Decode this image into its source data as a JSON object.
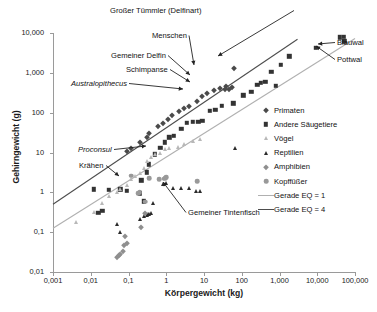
{
  "chart_data": {
    "type": "scatter",
    "title": "",
    "xlabel": "Körpergewicht (kg)",
    "ylabel": "Gehirngewicht (g)",
    "xscale": "log",
    "yscale": "log",
    "xlim": [
      0.001,
      100000
    ],
    "ylim": [
      0.01,
      10000
    ],
    "xticks": [
      "0,001",
      "0,01",
      "0,1",
      "1",
      "10",
      "100",
      "1,000",
      "10,000",
      "100,000"
    ],
    "xtick_values": [
      0.001,
      0.01,
      0.1,
      1,
      10,
      100,
      1000,
      10000,
      100000
    ],
    "yticks": [
      "0,01",
      "0,1",
      "1",
      "10",
      "100",
      "1,000",
      "10,000"
    ],
    "ytick_values": [
      0.01,
      0.1,
      1,
      10,
      100,
      1000,
      10000
    ],
    "grid": false,
    "legend_position": "right",
    "series": [
      {
        "name": "Primaten",
        "marker": "diamond",
        "color": "#4a4a4a",
        "points": [
          [
            0.09,
            11
          ],
          [
            0.12,
            13
          ],
          [
            0.2,
            18
          ],
          [
            0.3,
            24
          ],
          [
            0.35,
            30
          ],
          [
            0.6,
            45
          ],
          [
            0.8,
            55
          ],
          [
            1.1,
            70
          ],
          [
            1.4,
            85
          ],
          [
            2.2,
            110
          ],
          [
            3.0,
            130
          ],
          [
            4.0,
            150
          ],
          [
            6.5,
            200
          ],
          [
            9.0,
            260
          ],
          [
            12,
            310
          ],
          [
            18,
            380
          ],
          [
            26,
            420
          ],
          [
            38,
            480
          ],
          [
            55,
            430
          ],
          [
            62,
            1350
          ],
          [
            45,
            400
          ],
          [
            35,
            390
          ]
        ]
      },
      {
        "name": "Andere Säugetiere",
        "marker": "square",
        "color": "#333333",
        "points": [
          [
            0.012,
            1.2
          ],
          [
            0.016,
            0.31
          ],
          [
            0.02,
            0.34
          ],
          [
            0.03,
            1.15
          ],
          [
            0.06,
            1.2
          ],
          [
            0.09,
            1.1
          ],
          [
            0.2,
            0.95
          ],
          [
            0.25,
            0.6
          ],
          [
            0.22,
            2.0
          ],
          [
            0.3,
            3.2
          ],
          [
            0.35,
            5.0
          ],
          [
            0.5,
            9.0
          ],
          [
            0.7,
            13
          ],
          [
            0.9,
            18
          ],
          [
            1.2,
            24
          ],
          [
            1.6,
            26
          ],
          [
            2.5,
            40
          ],
          [
            3.5,
            55
          ],
          [
            5.0,
            58
          ],
          [
            7.0,
            60
          ],
          [
            9.0,
            62
          ],
          [
            14,
            110
          ],
          [
            20,
            120
          ],
          [
            30,
            150
          ],
          [
            60,
            170
          ],
          [
            110,
            270
          ],
          [
            180,
            330
          ],
          [
            260,
            500
          ],
          [
            320,
            560
          ],
          [
            420,
            600
          ],
          [
            600,
            1050
          ],
          [
            800,
            480
          ],
          [
            1100,
            1600
          ],
          [
            1800,
            2600
          ],
          [
            9000,
            4200
          ],
          [
            40000,
            7800
          ],
          [
            50000,
            7900
          ],
          [
            52000,
            6200
          ]
        ]
      },
      {
        "name": "Vögel",
        "marker": "triangle",
        "color": "#b8b8b8",
        "points": [
          [
            0.004,
            0.18
          ],
          [
            0.012,
            0.32
          ],
          [
            0.02,
            0.55
          ],
          [
            0.03,
            0.8
          ],
          [
            0.05,
            1.0
          ],
          [
            0.06,
            1.2
          ],
          [
            0.09,
            1.5
          ],
          [
            0.12,
            2.2
          ],
          [
            0.15,
            2.6
          ],
          [
            0.2,
            3.0
          ],
          [
            0.25,
            4.2
          ],
          [
            0.3,
            6.0
          ],
          [
            0.4,
            7.5
          ],
          [
            0.5,
            9.0
          ],
          [
            0.7,
            10
          ],
          [
            0.9,
            12
          ],
          [
            1.2,
            13
          ],
          [
            2.0,
            14
          ],
          [
            3.0,
            16
          ],
          [
            5.0,
            20
          ],
          [
            8.0,
            22
          ]
        ]
      },
      {
        "name": "Reptilien",
        "marker": "triangle",
        "color": "#2b2b2b",
        "points": [
          [
            0.05,
            0.16
          ],
          [
            0.06,
            0.1
          ],
          [
            0.2,
            0.21
          ],
          [
            0.25,
            0.26
          ],
          [
            0.3,
            0.27
          ],
          [
            0.32,
            0.28
          ],
          [
            0.35,
            0.29
          ],
          [
            0.4,
            0.3
          ],
          [
            0.45,
            0.55
          ],
          [
            0.8,
            1.6
          ],
          [
            1.0,
            1.7
          ],
          [
            1.5,
            1.3
          ],
          [
            2.5,
            1.25
          ],
          [
            4.0,
            1.3
          ],
          [
            6.0,
            1.05
          ],
          [
            8.0,
            1.1
          ],
          [
            65,
            13
          ]
        ]
      },
      {
        "name": "Amphibien",
        "marker": "diamond",
        "color": "#8f8f8f",
        "points": [
          [
            0.05,
            0.024
          ],
          [
            0.055,
            0.026
          ],
          [
            0.06,
            0.028
          ],
          [
            0.07,
            0.033
          ],
          [
            0.075,
            0.048
          ],
          [
            0.09,
            0.052
          ],
          [
            0.08,
            0.082
          ],
          [
            0.22,
            0.135
          ],
          [
            0.28,
            0.3
          ]
        ]
      },
      {
        "name": "Kopffüßer",
        "marker": "circle",
        "color": "#999999",
        "points": [
          [
            0.18,
            0.95
          ],
          [
            0.2,
            1.0
          ],
          [
            0.28,
            0.58
          ],
          [
            0.35,
            2.3
          ],
          [
            0.65,
            2.1
          ],
          [
            0.85,
            2.2
          ],
          [
            0.95,
            2.3
          ],
          [
            1.0,
            2.4
          ],
          [
            6.5,
            1.9
          ],
          [
            0.12,
            2.6
          ]
        ]
      }
    ],
    "lines": [
      {
        "name": "Gerade EQ = 1",
        "color": "#b0b0b0",
        "from": [
          0.001,
          0.125
        ],
        "to": [
          100000,
          7300
        ]
      },
      {
        "name": "Gerade EQ = 4",
        "color": "#4d4d4d",
        "from": [
          0.001,
          0.5
        ],
        "to": [
          3000,
          7000
        ]
      }
    ],
    "annotations": [
      {
        "label": "Großer Tümmler (Delfinart)",
        "italic": false,
        "text_x": 201,
        "text_y": 6,
        "tip_x": 218,
        "tip_y": 56
      },
      {
        "label": "Menschen",
        "italic": false,
        "text_x": 152,
        "text_y": 31,
        "tip_x": 194,
        "tip_y": 65
      },
      {
        "label": "Gemeiner Delfin",
        "italic": false,
        "text_x": 111,
        "text_y": 51,
        "tip_x": 190,
        "tip_y": 75
      },
      {
        "label": "Schimpanse",
        "italic": false,
        "text_x": 126,
        "text_y": 65,
        "tip_x": 190,
        "tip_y": 82
      },
      {
        "label": "Australopithecus",
        "italic": true,
        "text_x": 71,
        "text_y": 79,
        "tip_x": 183,
        "tip_y": 89
      },
      {
        "label": "Proconsul",
        "italic": true,
        "text_x": 78,
        "text_y": 145,
        "tip_x": 146,
        "tip_y": 146
      },
      {
        "label": "Krähen",
        "italic": false,
        "text_x": 79,
        "text_y": 161,
        "tip_x": 119,
        "tip_y": 176
      },
      {
        "label": "Blauwal",
        "italic": false,
        "text_x": 337,
        "text_y": 38,
        "tip_x": 318,
        "tip_y": 44
      },
      {
        "label": "Pottwal",
        "italic": false,
        "text_x": 337,
        "text_y": 55,
        "tip_x": 316,
        "tip_y": 46
      },
      {
        "label": "Gemeiner Tintenfisch",
        "italic": false,
        "text_x": 188,
        "text_y": 208,
        "tip_x": 163,
        "tip_y": 182
      }
    ],
    "legend": [
      {
        "label": "Primaten",
        "kind": "marker",
        "marker": "diamond",
        "color": "#4a4a4a"
      },
      {
        "label": "Andere Säugetiere",
        "kind": "marker",
        "marker": "square",
        "color": "#333333"
      },
      {
        "label": "Vögel",
        "kind": "marker",
        "marker": "triangle",
        "color": "#b8b8b8"
      },
      {
        "label": "Reptilien",
        "kind": "marker",
        "marker": "triangle",
        "color": "#2b2b2b"
      },
      {
        "label": "Amphibien",
        "kind": "marker",
        "marker": "diamond",
        "color": "#8f8f8f"
      },
      {
        "label": "Kopffüßer",
        "kind": "marker",
        "marker": "circle",
        "color": "#999999"
      },
      {
        "label": "Gerade EQ = 1",
        "kind": "line",
        "color": "#b0b0b0"
      },
      {
        "label": "Gerade EQ = 4",
        "kind": "line",
        "color": "#4d4d4d"
      }
    ]
  }
}
